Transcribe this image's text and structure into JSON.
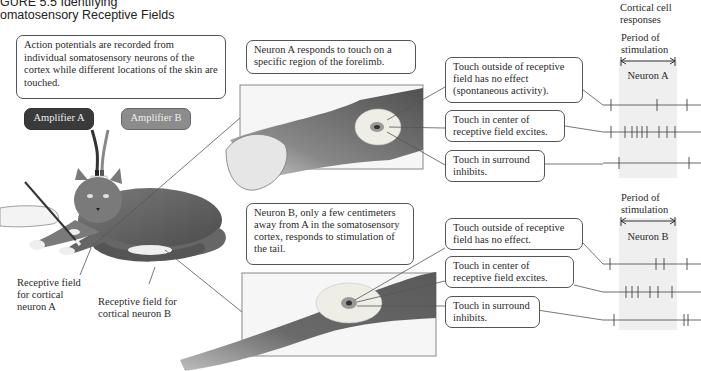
{
  "figure": {
    "title_line1": "GURE 5.5  Identifying",
    "title_line2": "omatosensory Receptive Fields"
  },
  "intro_box": "Action potentials are recorded from individual somatosensory neurons of the cortex while different locations of the skin are touched.",
  "amplifiers": [
    {
      "label": "Amplifier A",
      "color": "#3a3a3a"
    },
    {
      "label": "Amplifier B",
      "color": "#8c8c8c"
    }
  ],
  "cat_labels": {
    "rf_a": "Receptive field for cortical neuron A",
    "rf_b": "Receptive field for cortical neuron B"
  },
  "column_header": {
    "line1": "Cortical cell",
    "line2": "responses"
  },
  "neuron_a": {
    "description": "Neuron A responds to touch on a specific region of the forelimb.",
    "period_label_1": "Period of",
    "period_label_2": "stimulation",
    "name": "Neuron A",
    "callouts": [
      "Touch outside of receptive field has no effect (spontaneous activity).",
      "Touch in center of receptive field excites.",
      "Touch in surround inhibits."
    ]
  },
  "neuron_b": {
    "description": "Neuron B, only a few centimeters away from A in the somatosensory cortex, responds to stimulation of the tail.",
    "period_label_1": "Period of",
    "period_label_2": "stimulation",
    "name": "Neuron B",
    "callouts": [
      "Touch outside of receptive field has no effect.",
      "Touch in center of receptive field excites.",
      "Touch in surround inhibits."
    ]
  },
  "spike_trains": {
    "neuron_a": [
      {
        "condition": "outside",
        "spikes_x": [
          611,
          657,
          687
        ]
      },
      {
        "condition": "center",
        "spikes_x": [
          611,
          625,
          632,
          637,
          642,
          647,
          659,
          667,
          675
        ]
      },
      {
        "condition": "surround",
        "spikes_x": [
          619,
          689
        ]
      }
    ],
    "neuron_b": [
      {
        "condition": "outside",
        "spikes_x": [
          610,
          656,
          664,
          687
        ]
      },
      {
        "condition": "center",
        "spikes_x": [
          626,
          632,
          638,
          650,
          658,
          672
        ]
      },
      {
        "condition": "surround",
        "spikes_x": [
          614,
          684,
          688
        ]
      }
    ]
  }
}
